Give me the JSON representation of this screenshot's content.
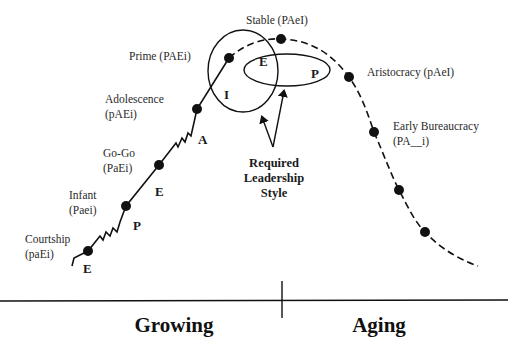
{
  "diagram": {
    "stages": [
      {
        "id": "courtship",
        "name": "Courtship",
        "code": "(paEi)"
      },
      {
        "id": "infant",
        "name": "Infant",
        "code": "(Paei)"
      },
      {
        "id": "gogo",
        "name": "Go-Go",
        "code": "(PaEi)"
      },
      {
        "id": "adolescence",
        "name": "Adolescence",
        "code": "(pAEi)"
      },
      {
        "id": "prime",
        "name": "Prime",
        "code": "(PAEi)"
      },
      {
        "id": "stable",
        "name": "Stable",
        "code": "(PAeI)"
      },
      {
        "id": "aristocracy",
        "name": "Aristocracy",
        "code": "(pAeI)"
      },
      {
        "id": "early-bureaucracy",
        "name": "Early Bureaucracy",
        "code": "(PA__i)"
      },
      {
        "id": "later-1",
        "name": "",
        "code": ""
      },
      {
        "id": "later-2",
        "name": "",
        "code": ""
      }
    ],
    "labels": {
      "prime": "Prime (PAEi)",
      "stable": "Stable (PAeI)",
      "aristocracy": "Aristocracy (pAeI)",
      "adolescence_name": "Adolescence",
      "adolescence_code": "(pAEi)",
      "gogo_name": "Go-Go",
      "gogo_code": "(PaEi)",
      "infant_name": "Infant",
      "infant_code": "(Paei)",
      "courtship_name": "Courtship",
      "courtship_code": "(paEi)",
      "early_bureaucracy_name": "Early Bureaucracy",
      "early_bureaucracy_code": "(PA__i)"
    },
    "transition_letters": {
      "courtship": "E",
      "infant": "P",
      "gogo": "E",
      "adolescence": "A"
    },
    "leadership_sets": {
      "circle_letter": "I",
      "overlap_letter": "E",
      "ellipse_letter": "P"
    },
    "callout": {
      "line1": "Required",
      "line2": "Leadership",
      "line3": "Style"
    },
    "phases": {
      "left": "Growing",
      "right": "Aging"
    },
    "legend": {
      "solid_line": "growing stages",
      "dashed_line": "aging stages"
    },
    "colors": {
      "ink": "#111111",
      "background": "#ffffff"
    }
  }
}
